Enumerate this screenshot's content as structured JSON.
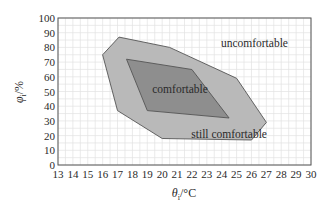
{
  "chart_data": {
    "type": "area",
    "title": "",
    "xlabel": "θi/°C",
    "ylabel": "φi/%",
    "xlim": [
      13,
      30
    ],
    "ylim": [
      0,
      100
    ],
    "x_ticks": [
      13,
      14,
      15,
      16,
      17,
      18,
      19,
      20,
      21,
      22,
      23,
      24,
      25,
      26,
      27,
      28,
      29,
      30
    ],
    "y_ticks": [
      0,
      10,
      20,
      30,
      40,
      50,
      60,
      70,
      80,
      90,
      100
    ],
    "grid": true,
    "series": [
      {
        "name": "still comfortable",
        "color": "#b9b9b9",
        "points": [
          [
            17.1,
            87
          ],
          [
            20.5,
            80
          ],
          [
            25,
            59
          ],
          [
            27,
            29
          ],
          [
            26,
            17
          ],
          [
            20,
            18
          ],
          [
            17,
            37
          ],
          [
            16,
            75
          ]
        ]
      },
      {
        "name": "comfortable",
        "color": "#8e8e8e",
        "points": [
          [
            17.6,
            72
          ],
          [
            22,
            65
          ],
          [
            24.5,
            32
          ],
          [
            19,
            37
          ]
        ]
      }
    ],
    "annotations": [
      {
        "text": "uncomfortable",
        "x": 26.2,
        "y": 83
      },
      {
        "text": "comfortable",
        "x": 21.2,
        "y": 52
      },
      {
        "text": "still comfortable",
        "x": 24.5,
        "y": 21
      }
    ]
  },
  "labels": {
    "xlabel_main": "θ",
    "xlabel_sub": "i",
    "xlabel_unit": "/°C",
    "ylabel_main": "φ",
    "ylabel_sub": "i",
    "ylabel_unit": "/%"
  }
}
